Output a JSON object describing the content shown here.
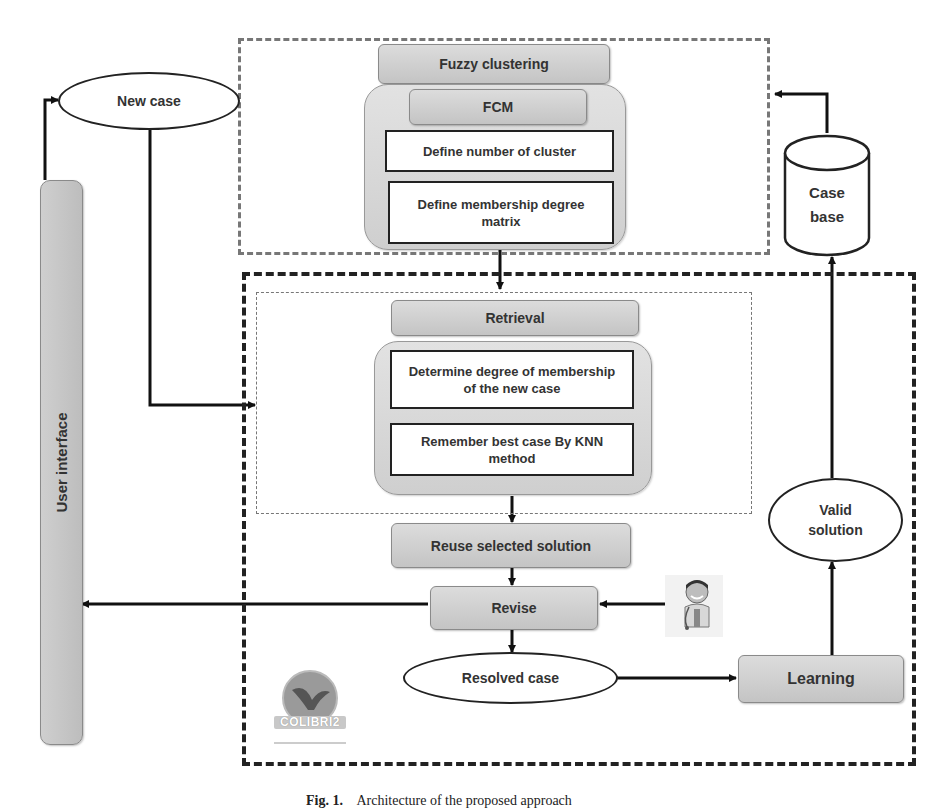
{
  "diagram": {
    "type": "architecture-flowchart",
    "groups": {
      "clustering_region": "Fuzzy clustering module (grey dashed box)",
      "cbr_region": "CBR cycle (black dashed box)",
      "retrieval_region": "Retrieval sub-process (thin dashed box)"
    },
    "user_interface": {
      "label": "User interface"
    },
    "new_case": {
      "label": "New case"
    },
    "fuzzy_clustering": {
      "title": "Fuzzy clustering",
      "method": "FCM",
      "steps": [
        "Define number of cluster",
        "Define membership degree matrix"
      ]
    },
    "case_base": {
      "label_line1": "Case",
      "label_line2": "base"
    },
    "retrieval": {
      "title": "Retrieval",
      "steps": [
        "Determine degree of membership of the new case",
        "Remember best case By KNN method"
      ]
    },
    "reuse": {
      "label": "Reuse selected solution"
    },
    "revise": {
      "label": "Revise"
    },
    "expert": {
      "icon": "doctor-icon"
    },
    "resolved_case": {
      "label": "Resolved case"
    },
    "learning": {
      "label": "Learning"
    },
    "valid_solution": {
      "label_line1": "Valid",
      "label_line2": "solution"
    },
    "logo": {
      "text": "COLIBRI2"
    },
    "edges": [
      {
        "from": "User interface",
        "to": "New case"
      },
      {
        "from": "New case",
        "to": "Retrieval"
      },
      {
        "from": "Case base",
        "to": "Fuzzy clustering"
      },
      {
        "from": "Define number of cluster",
        "to": "Define membership degree matrix"
      },
      {
        "from": "Fuzzy clustering",
        "to": "Retrieval"
      },
      {
        "from": "Determine degree of membership of the new case",
        "to": "Remember best case By KNN method"
      },
      {
        "from": "Retrieval",
        "to": "Reuse selected solution"
      },
      {
        "from": "Reuse selected solution",
        "to": "Revise"
      },
      {
        "from": "Expert",
        "to": "Revise"
      },
      {
        "from": "Revise",
        "to": "User interface"
      },
      {
        "from": "Revise",
        "to": "Resolved case"
      },
      {
        "from": "Resolved case",
        "to": "Learning"
      },
      {
        "from": "Learning",
        "to": "Valid solution"
      },
      {
        "from": "Valid solution",
        "to": "Case base"
      }
    ]
  },
  "caption": {
    "prefix": "Fig. 1.",
    "text": "Architecture of the proposed approach"
  }
}
